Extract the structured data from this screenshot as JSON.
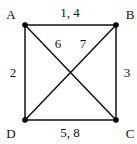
{
  "graph": {
    "nodes": [
      {
        "id": "A",
        "label": "A",
        "x": 25,
        "y": 25,
        "lx": 11,
        "ly": 18
      },
      {
        "id": "B",
        "label": "B",
        "x": 116,
        "y": 25,
        "lx": 130,
        "ly": 18
      },
      {
        "id": "C",
        "label": "C",
        "x": 116,
        "y": 120,
        "lx": 130,
        "ly": 138
      },
      {
        "id": "D",
        "label": "D",
        "x": 25,
        "y": 120,
        "lx": 11,
        "ly": 138
      }
    ],
    "edges": [
      {
        "from": "A",
        "to": "B",
        "label": "1, 4"
      },
      {
        "from": "A",
        "to": "D",
        "label": "2"
      },
      {
        "from": "B",
        "to": "C",
        "label": "3"
      },
      {
        "from": "D",
        "to": "C",
        "label": "5, 8"
      },
      {
        "from": "A",
        "to": "C",
        "label": "6"
      },
      {
        "from": "B",
        "to": "D",
        "label": "7"
      }
    ]
  },
  "labels": {
    "A": "A",
    "B": "B",
    "C": "C",
    "D": "D",
    "AB": "1, 4",
    "AD": "2",
    "BC": "3",
    "DC": "5, 8",
    "AC": "6",
    "BD": "7"
  },
  "colors": {
    "line": "#111111",
    "node": "#000000",
    "background": "#ffffff"
  }
}
